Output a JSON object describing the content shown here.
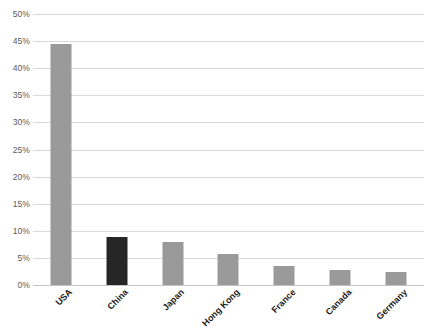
{
  "chart_data": {
    "type": "bar",
    "title": "",
    "xlabel": "",
    "ylabel": "",
    "categories": [
      "USA",
      "China",
      "Japan",
      "Hong Kong",
      "France",
      "Canada",
      "Germany"
    ],
    "values": [
      44.5,
      8.9,
      8.0,
      5.7,
      3.5,
      2.7,
      2.4
    ],
    "value_unit": "%",
    "ylim": [
      0,
      50
    ],
    "ytick_labels": [
      "50%",
      "45%",
      "40%",
      "35%",
      "30%",
      "25%",
      "20%",
      "15%",
      "10%",
      "5%",
      "0%"
    ],
    "ytick_values": [
      50,
      45,
      40,
      35,
      30,
      25,
      20,
      15,
      10,
      5,
      0
    ],
    "grid": true,
    "legend": "none",
    "series": [
      {
        "name": "Share",
        "values": [
          44.5,
          8.9,
          8.0,
          5.7,
          3.5,
          2.7,
          2.4
        ],
        "bar_colors": [
          "#9a9a9a",
          "#262626",
          "#9a9a9a",
          "#9a9a9a",
          "#9a9a9a",
          "#9a9a9a",
          "#9a9a9a"
        ]
      }
    ],
    "highlight_category": "China",
    "colors": {
      "bar": "#9a9a9a",
      "bar_highlight": "#262626",
      "gridline": "#d9d9d9",
      "axis": "#c4c4c4",
      "ytick_text": "#5a5a5a",
      "xtick_text": "#1a1a1a",
      "background": "#ffffff"
    }
  }
}
